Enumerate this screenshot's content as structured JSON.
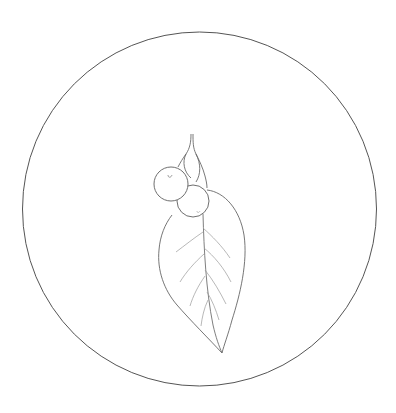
{
  "illustration": {
    "subject": "leaf with two berries inside a circle",
    "stroke_color": "#5a5a5a",
    "fine_stroke_color": "#8a8a8a",
    "background": "#ffffff",
    "frame": {
      "shape": "circle",
      "cx": 199.5,
      "cy": 209,
      "r": 177
    },
    "berries": [
      {
        "name": "berry-upper",
        "cx": 171,
        "cy": 184,
        "r": 17
      },
      {
        "name": "berry-lower",
        "cx": 193,
        "cy": 201,
        "r": 16
      }
    ],
    "leaf": {
      "tip_x": 222,
      "tip_y": 353
    }
  }
}
